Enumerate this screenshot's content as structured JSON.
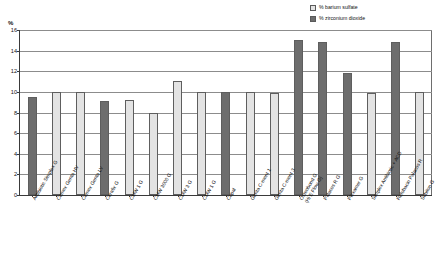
{
  "axis_title": "%",
  "legend": {
    "items": [
      {
        "label": "% barium sulfate",
        "swatch": "light",
        "color": "#e3e3e3"
      },
      {
        "label": "% zirconium dioxide",
        "swatch": "dark",
        "color": "#6d6d6d"
      }
    ]
  },
  "colors": {
    "barium_sulfate": "#e3e3e3",
    "zirconium_dioxide": "#6d6d6d",
    "bar_outline": "#5e5e5e",
    "gridline": "#8c8c8c",
    "axis": "#3a3a3a",
    "background": "#ffffff"
  },
  "chart_data": {
    "type": "bar",
    "title": "",
    "subtitle": "",
    "xlabel": "",
    "ylabel": "%",
    "ylim": [
      0,
      16
    ],
    "ytick_labels": [
      "0",
      "2",
      "4",
      "6",
      "8",
      "10",
      "12",
      "14",
      "16"
    ],
    "yticks": [
      0,
      2,
      4,
      6,
      8,
      10,
      12,
      14,
      16
    ],
    "grid": true,
    "legend_position": "top-right",
    "categories": [
      "Antibiotic Simplex G",
      "Cemex Genta HV",
      "Cemex Genta LV",
      "Cerafix G",
      "CMW 1 G",
      "CMW 3000 G",
      "CMW 3 G",
      "CMW 1 G",
      "Copal",
      "Genta C-ment 1",
      "Genta C-ment 3",
      "Osteobond G (Hi E Flow G)",
      "Palacos R G",
      "Plexamer G",
      "Simplex Antibiotic + ACD",
      "Refobacin Palacos R",
      "Subiton G"
    ],
    "category_lines": [
      [
        "Antibiotic Simplex G",
        ""
      ],
      [
        "Cemex Genta HV",
        ""
      ],
      [
        "Cemex Genta LV",
        ""
      ],
      [
        "Cerafix G",
        ""
      ],
      [
        "CMW 1 G",
        ""
      ],
      [
        "CMW 3000 G",
        ""
      ],
      [
        "CMW 3 G",
        ""
      ],
      [
        "CMW 1 G",
        ""
      ],
      [
        "Copal",
        ""
      ],
      [
        "Genta C-ment 1",
        ""
      ],
      [
        "Genta C-ment 3",
        ""
      ],
      [
        "Osteobond G",
        "(Hi E Flow G)"
      ],
      [
        "Palacos R G",
        ""
      ],
      [
        "Plexamer G",
        ""
      ],
      [
        "Simplex Antibiotic + ACD",
        ""
      ],
      [
        "Refobacin Palacos R",
        ""
      ],
      [
        "Subiton G",
        ""
      ]
    ],
    "series": [
      {
        "name": "% barium sulfate",
        "values": [
          null,
          10.0,
          10.0,
          null,
          9.2,
          8.0,
          11.1,
          10.0,
          null,
          10.0,
          9.9,
          null,
          null,
          null,
          9.9,
          null,
          10.0
        ]
      },
      {
        "name": "% zirconium dioxide",
        "values": [
          9.5,
          null,
          null,
          9.1,
          null,
          null,
          null,
          null,
          10.0,
          null,
          null,
          15.0,
          14.8,
          11.8,
          null,
          14.8,
          null
        ]
      }
    ],
    "bars": [
      {
        "category": "Antibiotic Simplex G",
        "value": 9.5,
        "series": "% zirconium dioxide",
        "fill": "dark"
      },
      {
        "category": "Cemex Genta HV",
        "value": 10.0,
        "series": "% barium sulfate",
        "fill": "light"
      },
      {
        "category": "Cemex Genta LV",
        "value": 10.0,
        "series": "% barium sulfate",
        "fill": "light"
      },
      {
        "category": "Cerafix G",
        "value": 9.1,
        "series": "% zirconium dioxide",
        "fill": "dark"
      },
      {
        "category": "CMW 1 G",
        "value": 9.2,
        "series": "% barium sulfate",
        "fill": "light"
      },
      {
        "category": "CMW 3000 G",
        "value": 8.0,
        "series": "% barium sulfate",
        "fill": "light"
      },
      {
        "category": "CMW 3 G",
        "value": 11.1,
        "series": "% barium sulfate",
        "fill": "light"
      },
      {
        "category": "CMW 1 G",
        "value": 10.0,
        "series": "% barium sulfate",
        "fill": "light"
      },
      {
        "category": "Copal",
        "value": 10.0,
        "series": "% zirconium dioxide",
        "fill": "dark"
      },
      {
        "category": "Genta C-ment 1",
        "value": 10.0,
        "series": "% barium sulfate",
        "fill": "light"
      },
      {
        "category": "Genta C-ment 3",
        "value": 9.9,
        "series": "% barium sulfate",
        "fill": "light"
      },
      {
        "category": "Osteobond G (Hi E Flow G)",
        "value": 15.0,
        "series": "% zirconium dioxide",
        "fill": "dark"
      },
      {
        "category": "Palacos R G",
        "value": 14.8,
        "series": "% zirconium dioxide",
        "fill": "dark"
      },
      {
        "category": "Plexamer G",
        "value": 11.8,
        "series": "% zirconium dioxide",
        "fill": "dark"
      },
      {
        "category": "Simplex Antibiotic + ACD",
        "value": 9.9,
        "series": "% barium sulfate",
        "fill": "light"
      },
      {
        "category": "Refobacin Palacos R",
        "value": 14.8,
        "series": "% zirconium dioxide",
        "fill": "dark"
      },
      {
        "category": "Subiton G",
        "value": 10.0,
        "series": "% barium sulfate",
        "fill": "light"
      }
    ]
  }
}
